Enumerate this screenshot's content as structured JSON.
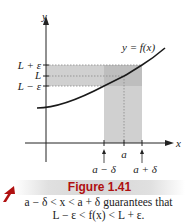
{
  "figure": {
    "axis_labels": {
      "y": "y",
      "x": "x"
    },
    "curve_label": "y = f(x)",
    "y_ticks": [
      "L + ε",
      "L",
      "L − ε"
    ],
    "x_ticks": [
      "a − δ",
      "a",
      "a + δ"
    ],
    "colors": {
      "curve": "#1a1a1a",
      "shading": "#c8c8c8",
      "banner_text": "#b01010",
      "arrow": "#b01010"
    }
  },
  "banner": {
    "title": "Figure 1.41"
  },
  "caption": {
    "line1": "a − δ < x < a + δ guarantees that",
    "line2": "L − ε < f(x) < L + ε."
  }
}
